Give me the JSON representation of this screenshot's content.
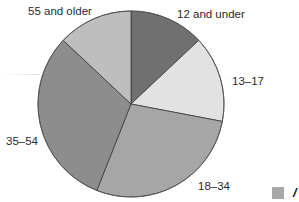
{
  "chart_data": {
    "type": "pie",
    "title": "",
    "start_angle_deg": 0,
    "direction": "clockwise",
    "categories": [
      "12 and under",
      "13–17",
      "18–34",
      "35–54",
      "55 and older"
    ],
    "values": [
      13,
      15,
      28,
      31,
      13
    ],
    "unit": "percent (estimated from slice angles)",
    "colors": [
      "#707070",
      "#e2e2e2",
      "#a6a6a6",
      "#8d8d8d",
      "#bebebe"
    ],
    "legend": {
      "position": "bottom-right (cropped)",
      "visible_swatch_color": "#a8a8a8",
      "visible_text": "/"
    },
    "grid": false
  },
  "labels": {
    "slice_0": "12 and under",
    "slice_1": "13–17",
    "slice_2": "18–34",
    "slice_3": "35–54",
    "slice_4": "55 and older"
  },
  "legend": {
    "partial_text": "/"
  }
}
